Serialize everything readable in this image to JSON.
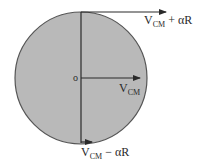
{
  "diagram": {
    "colors": {
      "disc_fill": "#b9b9b9",
      "disc_stroke": "#555555",
      "line": "#2a2a2a",
      "background": "#ffffff"
    },
    "center_label": "o",
    "labels": {
      "top": {
        "main": "V",
        "sub": "CM",
        "rest": " + αR"
      },
      "center": {
        "main": "V",
        "sub": "CM"
      },
      "bottom": {
        "main": "V",
        "sub": "CM",
        "rest": " − αR"
      }
    }
  }
}
